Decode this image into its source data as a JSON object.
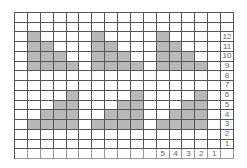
{
  "chart_data": {
    "type": "knitting-chart",
    "columns": 17,
    "rows": 15,
    "row_labels": [
      "",
      "",
      "12",
      "11",
      "10",
      "9",
      "8",
      "7",
      "6",
      "5",
      "4",
      "3",
      "2",
      "1",
      ""
    ],
    "column_labels": [
      "",
      "",
      "",
      "",
      "",
      "",
      "",
      "",
      "",
      "",
      "",
      "5",
      "4",
      "3",
      "2",
      "1",
      ""
    ],
    "shaded_cells": [
      [
        2,
        1
      ],
      [
        3,
        1
      ],
      [
        4,
        1
      ],
      [
        5,
        1
      ],
      [
        3,
        2
      ],
      [
        4,
        2
      ],
      [
        5,
        2
      ],
      [
        4,
        3
      ],
      [
        5,
        3
      ],
      [
        5,
        4
      ],
      [
        2,
        6
      ],
      [
        3,
        6
      ],
      [
        4,
        6
      ],
      [
        5,
        6
      ],
      [
        3,
        7
      ],
      [
        4,
        7
      ],
      [
        5,
        7
      ],
      [
        4,
        8
      ],
      [
        5,
        8
      ],
      [
        5,
        9
      ],
      [
        2,
        11
      ],
      [
        3,
        11
      ],
      [
        4,
        11
      ],
      [
        5,
        11
      ],
      [
        3,
        12
      ],
      [
        4,
        12
      ],
      [
        5,
        12
      ],
      [
        4,
        13
      ],
      [
        5,
        13
      ],
      [
        5,
        14
      ],
      [
        8,
        4
      ],
      [
        9,
        4
      ],
      [
        10,
        4
      ],
      [
        11,
        4
      ],
      [
        9,
        3
      ],
      [
        10,
        3
      ],
      [
        11,
        3
      ],
      [
        10,
        2
      ],
      [
        11,
        2
      ],
      [
        11,
        1
      ],
      [
        8,
        9
      ],
      [
        9,
        9
      ],
      [
        10,
        9
      ],
      [
        11,
        9
      ],
      [
        9,
        8
      ],
      [
        10,
        8
      ],
      [
        11,
        8
      ],
      [
        10,
        7
      ],
      [
        11,
        7
      ],
      [
        11,
        6
      ],
      [
        8,
        14
      ],
      [
        9,
        14
      ],
      [
        10,
        14
      ],
      [
        11,
        14
      ],
      [
        9,
        13
      ],
      [
        10,
        13
      ],
      [
        11,
        13
      ],
      [
        10,
        12
      ],
      [
        11,
        12
      ],
      [
        11,
        11
      ]
    ],
    "colors": {
      "shade": "#b9b9b9",
      "line": "#555555",
      "label": "#666666"
    }
  }
}
